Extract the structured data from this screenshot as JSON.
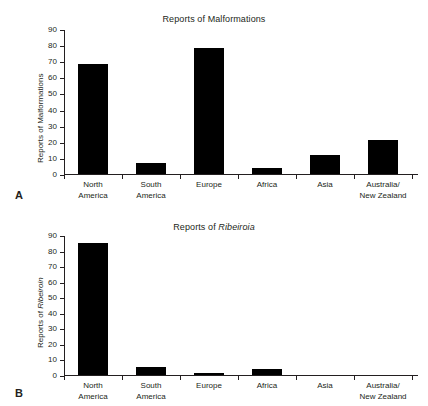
{
  "figure": {
    "panels": [
      {
        "letter": "A",
        "title_prefix": "Reports of ",
        "title_sci": "",
        "title_suffix": "Malformations",
        "ylabel_prefix": "Reports of ",
        "ylabel_sci": "",
        "ylabel_suffix": "Malformations"
      },
      {
        "letter": "B",
        "title_prefix": "Reports of ",
        "title_sci": "Ribeiroia",
        "title_suffix": "",
        "ylabel_prefix": "Reports of ",
        "ylabel_sci": "Ribeiroin",
        "ylabel_suffix": ""
      }
    ]
  },
  "chart_data": [
    {
      "type": "bar",
      "panel": "A",
      "title": "Reports of Malformations",
      "xlabel": "",
      "ylabel": "Reports of Malformations",
      "categories": [
        "North\nAmerica",
        "South\nAmerica",
        "Europe",
        "Africa",
        "Asia",
        "Australia/\nNew Zealand"
      ],
      "category_lines": [
        [
          "North",
          "America"
        ],
        [
          "South",
          "America"
        ],
        [
          "Europe",
          ""
        ],
        [
          "Africa",
          ""
        ],
        [
          "Asia",
          ""
        ],
        [
          "Australia/",
          "New Zealand"
        ]
      ],
      "values": [
        68,
        7,
        78,
        4,
        12,
        21
      ],
      "ylim": [
        0,
        90
      ],
      "yticks": [
        0,
        10,
        20,
        30,
        40,
        50,
        60,
        70,
        80,
        90
      ],
      "grid": false,
      "legend": false,
      "bar_color": "#000000"
    },
    {
      "type": "bar",
      "panel": "B",
      "title": "Reports of Ribeiroia",
      "xlabel": "",
      "ylabel": "Reports of Ribeiroin",
      "categories": [
        "North\nAmerica",
        "South\nAmerica",
        "Europe",
        "Africa",
        "Asia",
        "Australia/\nNew Zealand"
      ],
      "category_lines": [
        [
          "North",
          "America"
        ],
        [
          "South",
          "America"
        ],
        [
          "Europe",
          ""
        ],
        [
          "Africa",
          ""
        ],
        [
          "Asia",
          ""
        ],
        [
          "Australia/",
          "New Zealand"
        ]
      ],
      "values": [
        85,
        5,
        1,
        4,
        0,
        0
      ],
      "ylim": [
        0,
        90
      ],
      "yticks": [
        0,
        10,
        20,
        30,
        40,
        50,
        60,
        70,
        80,
        90
      ],
      "grid": false,
      "legend": false,
      "bar_color": "#000000"
    }
  ]
}
